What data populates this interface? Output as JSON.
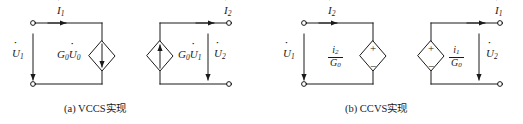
{
  "figure": {
    "panels": [
      {
        "id": "panel-a",
        "caption": "(a) VCCS实现",
        "left_port": {
          "current_label": "I",
          "current_sub": "1",
          "voltage_label": "U",
          "voltage_sub": "1"
        },
        "right_port": {
          "current_label": "I",
          "current_sub": "2",
          "voltage_label": "U",
          "voltage_sub": "2"
        },
        "sources": [
          {
            "type": "dependent-current-source",
            "label_main": "G",
            "label_main_sub": "0",
            "label_var": "U",
            "label_var_sub": "0",
            "arrow": "down"
          },
          {
            "type": "dependent-current-source",
            "label_main": "G",
            "label_main_sub": "0",
            "label_var": "U",
            "label_var_sub": "1",
            "arrow": "up"
          }
        ]
      },
      {
        "id": "panel-b",
        "caption": "(b) CCVS实现",
        "left_port": {
          "current_label": "I",
          "current_sub": "2",
          "voltage_label": "U",
          "voltage_sub": "1"
        },
        "right_port": {
          "current_label": "I",
          "current_sub": "1",
          "voltage_label": "U",
          "voltage_sub": "2"
        },
        "sources": [
          {
            "type": "dependent-voltage-source",
            "numerator": "i",
            "numerator_sub": "2",
            "denominator": "G",
            "denominator_sub": "0",
            "plus": "+",
            "minus": "−"
          },
          {
            "type": "dependent-voltage-source",
            "numerator": "i",
            "numerator_sub": "1",
            "denominator": "G",
            "denominator_sub": "0",
            "plus": "+",
            "minus": "−"
          }
        ]
      }
    ],
    "style": {
      "line_color": "#1a1a1a",
      "background": "#ffffff"
    }
  }
}
